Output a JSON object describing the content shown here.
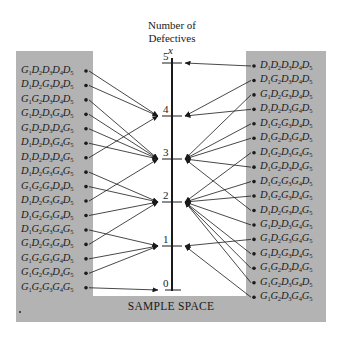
{
  "axis": {
    "title_line1": "Number of",
    "title_line2": "Defectives",
    "variable": "x",
    "ticks": [
      {
        "value": "5",
        "y": 63
      },
      {
        "value": "4",
        "y": 116
      },
      {
        "value": "3",
        "y": 159
      },
      {
        "value": "2",
        "y": 202
      },
      {
        "value": "1",
        "y": 246
      },
      {
        "value": "0",
        "y": 290
      }
    ]
  },
  "sample_space_label": "SAMPLE SPACE",
  "left_outcomes": [
    {
      "label": [
        "G",
        "1",
        "D",
        "2",
        "D",
        "3",
        "D",
        "4",
        "D",
        "5"
      ],
      "x_value": 4
    },
    {
      "label": [
        "D",
        "1",
        "D",
        "2",
        "G",
        "3",
        "D",
        "4",
        "D",
        "5"
      ],
      "x_value": 4
    },
    {
      "label": [
        "G",
        "1",
        "G",
        "2",
        "D",
        "3",
        "D",
        "4",
        "D",
        "5"
      ],
      "x_value": 3
    },
    {
      "label": [
        "G",
        "1",
        "D",
        "2",
        "D",
        "3",
        "G",
        "4",
        "D",
        "5"
      ],
      "x_value": 3
    },
    {
      "label": [
        "G",
        "1",
        "D",
        "2",
        "D",
        "3",
        "D",
        "4",
        "G",
        "5"
      ],
      "x_value": 3
    },
    {
      "label": [
        "D",
        "1",
        "D",
        "2",
        "D",
        "3",
        "G",
        "4",
        "G",
        "5"
      ],
      "x_value": 3
    },
    {
      "label": [
        "D",
        "1",
        "D",
        "2",
        "D",
        "3",
        "D",
        "4",
        "G",
        "5"
      ],
      "x_value": 4
    },
    {
      "label": [
        "D",
        "1",
        "D",
        "2",
        "G",
        "3",
        "G",
        "4",
        "G",
        "5"
      ],
      "x_value": 2
    },
    {
      "label": [
        "G",
        "1",
        "G",
        "2",
        "G",
        "3",
        "D",
        "4",
        "D",
        "5"
      ],
      "x_value": 2
    },
    {
      "label": [
        "D",
        "1",
        "D",
        "2",
        "G",
        "3",
        "G",
        "4",
        "D",
        "5"
      ],
      "x_value": 3
    },
    {
      "label": [
        "D",
        "1",
        "G",
        "2",
        "G",
        "3",
        "G",
        "4",
        "D",
        "5"
      ],
      "x_value": 2
    },
    {
      "label": [
        "D",
        "1",
        "G",
        "2",
        "G",
        "3",
        "G",
        "4",
        "G",
        "5"
      ],
      "x_value": 1
    },
    {
      "label": [
        "G",
        "1",
        "D",
        "2",
        "G",
        "3",
        "G",
        "4",
        "D",
        "5"
      ],
      "x_value": 2
    },
    {
      "label": [
        "G",
        "1",
        "G",
        "2",
        "G",
        "3",
        "G",
        "4",
        "D",
        "5"
      ],
      "x_value": 1
    },
    {
      "label": [
        "G",
        "1",
        "G",
        "2",
        "G",
        "3",
        "D",
        "4",
        "G",
        "5"
      ],
      "x_value": 1
    },
    {
      "label": [
        "G",
        "1",
        "G",
        "2",
        "G",
        "3",
        "G",
        "4",
        "G",
        "5"
      ],
      "x_value": 0
    }
  ],
  "right_outcomes": [
    {
      "label": [
        "D",
        "1",
        "D",
        "2",
        "D",
        "3",
        "D",
        "4",
        "D",
        "5"
      ],
      "x_value": 5
    },
    {
      "label": [
        "D",
        "1",
        "G",
        "2",
        "D",
        "3",
        "D",
        "4",
        "D",
        "5"
      ],
      "x_value": 4
    },
    {
      "label": [
        "G",
        "1",
        "D",
        "2",
        "G",
        "3",
        "D",
        "4",
        "D",
        "5"
      ],
      "x_value": 3
    },
    {
      "label": [
        "D",
        "1",
        "D",
        "2",
        "D",
        "3",
        "G",
        "4",
        "D",
        "5"
      ],
      "x_value": 4
    },
    {
      "label": [
        "D",
        "1",
        "G",
        "2",
        "G",
        "3",
        "D",
        "4",
        "D",
        "5"
      ],
      "x_value": 3
    },
    {
      "label": [
        "D",
        "1",
        "G",
        "2",
        "D",
        "3",
        "G",
        "4",
        "D",
        "5"
      ],
      "x_value": 3
    },
    {
      "label": [
        "D",
        "1",
        "G",
        "2",
        "D",
        "3",
        "G",
        "4",
        "G",
        "5"
      ],
      "x_value": 2
    },
    {
      "label": [
        "D",
        "1",
        "G",
        "2",
        "D",
        "3",
        "D",
        "4",
        "G",
        "5"
      ],
      "x_value": 3
    },
    {
      "label": [
        "D",
        "1",
        "G",
        "2",
        "G",
        "3",
        "G",
        "4",
        "D",
        "5"
      ],
      "x_value": 2
    },
    {
      "label": [
        "D",
        "1",
        "G",
        "2",
        "G",
        "3",
        "D",
        "4",
        "G",
        "5"
      ],
      "x_value": 2
    },
    {
      "label": [
        "D",
        "1",
        "D",
        "2",
        "G",
        "3",
        "D",
        "4",
        "G",
        "5"
      ],
      "x_value": 3
    },
    {
      "label": [
        "G",
        "1",
        "D",
        "2",
        "D",
        "3",
        "G",
        "4",
        "G",
        "5"
      ],
      "x_value": 2
    },
    {
      "label": [
        "G",
        "1",
        "D",
        "2",
        "G",
        "3",
        "G",
        "4",
        "G",
        "5"
      ],
      "x_value": 1
    },
    {
      "label": [
        "G",
        "1",
        "D",
        "2",
        "G",
        "3",
        "D",
        "4",
        "G",
        "5"
      ],
      "x_value": 2
    },
    {
      "label": [
        "G",
        "1",
        "G",
        "2",
        "D",
        "3",
        "D",
        "4",
        "G",
        "5"
      ],
      "x_value": 2
    },
    {
      "label": [
        "G",
        "1",
        "G",
        "2",
        "D",
        "3",
        "G",
        "4",
        "D",
        "5"
      ],
      "x_value": 2
    },
    {
      "label": [
        "G",
        "1",
        "G",
        "2",
        "D",
        "3",
        "G",
        "4",
        "G",
        "5"
      ],
      "x_value": 1
    }
  ],
  "colors": {
    "panel": "#b3b3b3",
    "ink": "#1a1a1a",
    "background": "#ffffff"
  }
}
